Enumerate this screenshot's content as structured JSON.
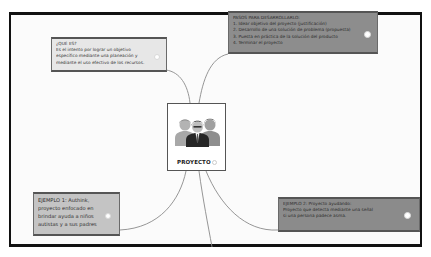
{
  "central_topic": {
    "label": "PROYECTO",
    "icon": "group-of-people-icon"
  },
  "nodes": [
    {
      "id": "que-es",
      "position": "top-left",
      "lines": [
        "¿QUÉ ES?",
        "Es el intento por lograr un objetivo",
        "específico mediante una planeación y",
        "mediante el uso efectivo de los recursos."
      ]
    },
    {
      "id": "pasos",
      "position": "top-right",
      "lines": [
        "PASOS PARA DESARROLLARLO:",
        "1. Idear objetivo del proyecto (justificación)",
        "2. Desarrollo de una solución de problema (propuesta)",
        "3. Puesta en práctica de la solución del producto",
        "4. Terminar el proyecto"
      ]
    },
    {
      "id": "ejemplo-1",
      "position": "bottom-left",
      "lines": [
        "EJEMPLO 1: Authink,",
        "proyecto enfocado en",
        "brindar ayuda a niños",
        "autistas y a sus padres"
      ]
    },
    {
      "id": "ejemplo-2",
      "position": "bottom-right",
      "lines": [
        "EJEMPLO 2: Proyecto ayudando:",
        "Proyecto que detecta mediante una señal",
        "si una persona padece asma."
      ]
    }
  ],
  "colors": {
    "frame_border": "#111111",
    "connector": "#8a8a8a",
    "node_light": "#e7e7e7",
    "node_mid": "#c4c4c4",
    "node_dark": "#8d8d8d",
    "central_bg": "#ffffff"
  }
}
